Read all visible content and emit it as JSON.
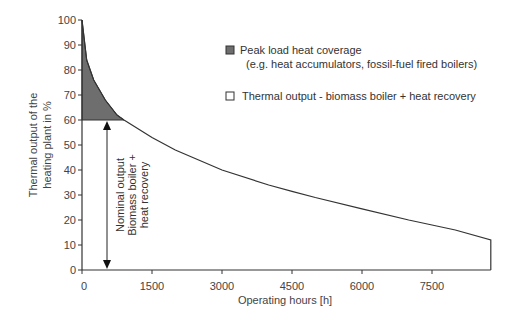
{
  "chart_data": {
    "type": "area",
    "title": "",
    "xlabel": "Operating hours [h]",
    "ylabel_lines": [
      "Thermal output of the",
      "heating plant in %"
    ],
    "xlim": [
      0,
      8760
    ],
    "ylim": [
      0,
      100
    ],
    "x_ticks": [
      0,
      1500,
      3000,
      4500,
      6000,
      7500
    ],
    "x_tick_labels": [
      "0",
      "1500",
      "3000",
      "4500",
      "6000",
      "7500"
    ],
    "y_ticks": [
      0,
      10,
      20,
      30,
      40,
      50,
      60,
      70,
      80,
      90,
      100
    ],
    "y_tick_labels": [
      "0",
      "10",
      "20",
      "30",
      "40",
      "50",
      "60",
      "70",
      "80",
      "90",
      "100"
    ],
    "grid": false,
    "series": [
      {
        "name": "Annual load duration curve",
        "x": [
          0,
          100,
          250,
          500,
          750,
          900,
          1500,
          2000,
          3000,
          4000,
          4500,
          5000,
          6000,
          7000,
          7500,
          8000,
          8760
        ],
        "values": [
          100,
          84,
          76,
          68,
          62,
          60,
          53,
          48,
          40,
          34,
          31.5,
          29,
          24.5,
          20,
          18,
          16,
          12
        ]
      }
    ],
    "shaded_regions": [
      {
        "name": "Peak load heat coverage",
        "from_y": 60,
        "to_curve": true,
        "x_range": [
          0,
          900
        ],
        "color": "#6e6e6e"
      }
    ],
    "annotations": [
      {
        "text_lines": [
          "Nominal output",
          "Biomass boiler +",
          "heat recovery"
        ],
        "type": "double-arrow",
        "x": 540,
        "y_range": [
          0,
          60
        ]
      }
    ],
    "legend": [
      {
        "label": "Peak load heat coverage",
        "sublabel": "(e.g. heat accumulators, fossil-fuel fired boilers)",
        "swatch": "filled-dark"
      },
      {
        "label": "Thermal output - biomass boiler + heat recovery",
        "swatch": "empty"
      }
    ],
    "legend_position": "upper-right-inside"
  },
  "colors": {
    "axis": "#333333",
    "peak_fill": "#6e6e6e",
    "curve": "#333333"
  }
}
